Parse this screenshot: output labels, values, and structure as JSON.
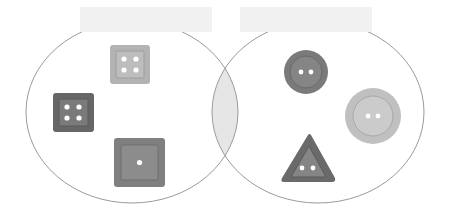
{
  "diagram": {
    "type": "venn",
    "sets": [
      {
        "id": "left",
        "label": "",
        "label_box_color": "#f1f1f1"
      },
      {
        "id": "right",
        "label": "",
        "label_box_color": "#f1f1f1"
      }
    ],
    "intersection": {
      "fill": "#e6e6e6",
      "items": []
    },
    "outline_color": "#9a9a9a"
  },
  "left_items": [
    {
      "shape": "square",
      "holes": 4,
      "fill": "#b3b3b3",
      "inner": "#a6a6a6",
      "size": "small"
    },
    {
      "shape": "square",
      "holes": 4,
      "fill": "#6e6e6e",
      "inner": "#808080",
      "size": "small"
    },
    {
      "shape": "square",
      "holes": 1,
      "fill": "#858585",
      "inner": "#8f8f8f",
      "size": "large"
    }
  ],
  "right_items": [
    {
      "shape": "circle",
      "holes": 2,
      "fill": "#7d7d7d",
      "inner": "#8a8a8a",
      "size": "medium"
    },
    {
      "shape": "circle",
      "holes": 2,
      "fill": "#c2c2c2",
      "inner": "#cccccc",
      "size": "large"
    },
    {
      "shape": "triangle",
      "holes": 2,
      "fill": "#6f6f6f",
      "inner": "#858585",
      "size": "medium"
    }
  ]
}
